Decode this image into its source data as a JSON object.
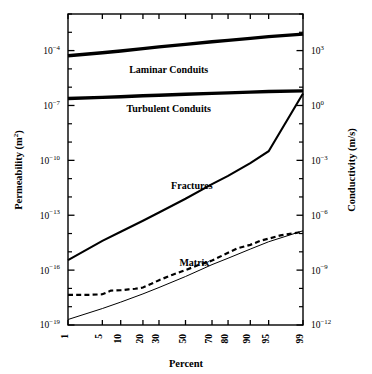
{
  "chart_data": {
    "type": "line",
    "title": "",
    "xlabel": "Percent",
    "ylabel": "Permeability (m²)",
    "y2label": "Conductivity (m/s)",
    "x_scale": "probability",
    "y_scale": "log",
    "xlim": [
      1,
      99
    ],
    "ylim": [
      1e-19,
      0.00316
    ],
    "y2lim": [
      1e-12,
      31600.0
    ],
    "grid": false,
    "legend": "inline-labels",
    "xticks": [
      1,
      5,
      10,
      20,
      30,
      50,
      70,
      80,
      90,
      95,
      99
    ],
    "xtick_labels": [
      "1",
      "5",
      "10",
      "20",
      "30",
      "50",
      "70",
      "80",
      "90",
      "95",
      "99"
    ],
    "yticks_labeled": [
      {
        "value": 0.0001,
        "mantissa": "10",
        "exponent": "-4"
      },
      {
        "value": 1e-07,
        "mantissa": "10",
        "exponent": "-7"
      },
      {
        "value": 1e-10,
        "mantissa": "10",
        "exponent": "-10"
      },
      {
        "value": 1e-13,
        "mantissa": "10",
        "exponent": "-13"
      },
      {
        "value": 1e-16,
        "mantissa": "10",
        "exponent": "-16"
      },
      {
        "value": 1e-19,
        "mantissa": "10",
        "exponent": "-19"
      }
    ],
    "y2ticks_labeled": [
      {
        "value": 1000.0,
        "mantissa": "10",
        "exponent": "3"
      },
      {
        "value": 1.0,
        "mantissa": "10",
        "exponent": "0"
      },
      {
        "value": 0.001,
        "mantissa": "10",
        "exponent": "-3"
      },
      {
        "value": 1e-06,
        "mantissa": "10",
        "exponent": "-6"
      },
      {
        "value": 1e-09,
        "mantissa": "10",
        "exponent": "-9"
      },
      {
        "value": 1e-12,
        "mantissa": "10",
        "exponent": "-12"
      }
    ],
    "series": [
      {
        "name": "Laminar Conduits",
        "label": "Laminar Conduits",
        "style": "solid-thick",
        "x": [
          1,
          5,
          10,
          20,
          30,
          50,
          70,
          80,
          90,
          95,
          99
        ],
        "log10_permeability": [
          -4.28,
          -4.12,
          -4.02,
          -3.89,
          -3.8,
          -3.66,
          -3.52,
          -3.44,
          -3.33,
          -3.24,
          -3.1
        ],
        "values": [
          5.2e-05,
          7.6e-05,
          9.6e-05,
          0.00013,
          0.00016,
          0.00022,
          0.0003,
          0.00036,
          0.00047,
          0.00058,
          0.00079
        ]
      },
      {
        "name": "Turbulent Conduits",
        "label": "Turbulent Conduits",
        "style": "solid-thick",
        "x": [
          1,
          5,
          10,
          20,
          30,
          50,
          70,
          80,
          90,
          95,
          99
        ],
        "log10_permeability": [
          -6.62,
          -6.56,
          -6.52,
          -6.47,
          -6.44,
          -6.39,
          -6.34,
          -6.31,
          -6.27,
          -6.24,
          -6.2
        ],
        "values": [
          2.4e-07,
          2.8e-07,
          3e-07,
          3.4e-07,
          3.6e-07,
          4.1e-07,
          4.6e-07,
          4.9e-07,
          5.4e-07,
          5.8e-07,
          6.3e-07
        ]
      },
      {
        "name": "Fractures",
        "label": "Fractures",
        "style": "solid-medium",
        "x": [
          1,
          5,
          10,
          20,
          30,
          50,
          70,
          80,
          90,
          95,
          99
        ],
        "log10_permeability": [
          -15.45,
          -14.4,
          -13.9,
          -13.3,
          -12.85,
          -12.1,
          -11.3,
          -10.85,
          -10.15,
          -9.5,
          -6.35
        ],
        "values": [
          3.5e-16,
          4e-15,
          1.3e-14,
          5e-14,
          1.4e-13,
          7.9e-13,
          5e-12,
          1.4e-11,
          7.1e-11,
          3.2e-10,
          4.5e-07
        ]
      },
      {
        "name": "Matrix",
        "label": "Matrix",
        "style": "solid-thin",
        "x": [
          1,
          5,
          10,
          20,
          30,
          50,
          70,
          80,
          90,
          95,
          99
        ],
        "log10_permeability": [
          -18.7,
          -18.1,
          -17.75,
          -17.3,
          -16.95,
          -16.35,
          -15.7,
          -15.35,
          -14.85,
          -14.45,
          -13.85
        ],
        "values": [
          2e-19,
          7.9e-19,
          1.8e-18,
          5e-18,
          1.1e-17,
          4.5e-17,
          2e-16,
          4.5e-16,
          1.4e-15,
          3.5e-15,
          1.4e-14
        ]
      },
      {
        "name": "Matrix (measured)",
        "label": "",
        "style": "dashed",
        "x": [
          1,
          3,
          5,
          7,
          10,
          13,
          16,
          20,
          25,
          30,
          40,
          50,
          60,
          70,
          80,
          85,
          90,
          93,
          95,
          97,
          99
        ],
        "log10_permeability": [
          -17.35,
          -17.35,
          -17.32,
          -17.12,
          -17.1,
          -17.05,
          -17.02,
          -16.95,
          -16.75,
          -16.55,
          -16.25,
          -16.0,
          -15.72,
          -15.48,
          -15.05,
          -14.8,
          -14.62,
          -14.4,
          -14.28,
          -14.1,
          -13.9
        ],
        "values": [
          4.5e-18,
          4.5e-18,
          4.8e-18,
          7.6e-18,
          7.9e-18,
          8.9e-18,
          9.5e-18,
          1.1e-17,
          1.8e-17,
          2.8e-17,
          5.6e-17,
          1e-16,
          1.9e-16,
          3.3e-16,
          8.9e-16,
          1.6e-15,
          2.4e-15,
          4e-15,
          5.2e-15,
          7.9e-15,
          1.3e-14
        ]
      }
    ],
    "annotations": [
      {
        "text": "Laminar Conduits",
        "x_pct": 37,
        "log10_y": -5.25
      },
      {
        "text": "Turbulent Conduits",
        "x_pct": 37,
        "log10_y": -7.35
      },
      {
        "text": "Fractures",
        "x_pct": 55,
        "log10_y": -11.55
      },
      {
        "text": "Matrix",
        "x_pct": 57,
        "log10_y": -15.75
      }
    ]
  },
  "colors": {
    "line": "#000000",
    "background": "#ffffff",
    "text": "#000000"
  }
}
